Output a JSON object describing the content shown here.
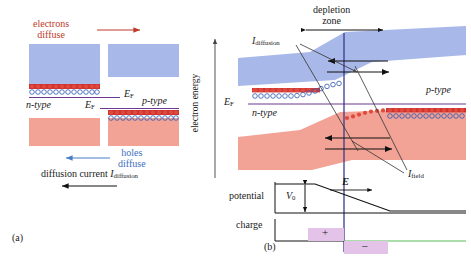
{
  "figure": {
    "panel_a": {
      "caption": "(a)",
      "labels": {
        "electrons_line1": "electrons",
        "electrons_line2": "diffuse",
        "holes_line1": "holes",
        "holes_line2": "diffuse",
        "n_type": "n-type",
        "p_type": "p-type",
        "fermi_left": "E",
        "fermi_left_sub": "F",
        "fermi_right": "E",
        "fermi_right_sub": "F",
        "diffusion_current": "diffusion current",
        "diffusion_current_sym": "I",
        "diffusion_current_sub": "diffusion"
      },
      "colors": {
        "conduction_band": "#a8b8e8",
        "valence_band": "#f2a396",
        "electron_dot": "#cc2222",
        "hole_circle": "#2a56b0",
        "fermi_line": "#6b3a8f",
        "electron_arrow": "#c0392b",
        "hole_arrow": "#4a7fc8",
        "current_arrow": "#111111"
      }
    },
    "axis": {
      "electron_energy": "electron energy"
    },
    "panel_b": {
      "caption": "(b)",
      "labels": {
        "depletion_line1": "depletion",
        "depletion_line2": "zone",
        "n_type": "n-type",
        "p_type": "p-type",
        "fermi": "E",
        "fermi_sub": "F",
        "i_diffusion": "I",
        "i_diffusion_sub": "diffusion",
        "i_field": "I",
        "i_field_sub": "field",
        "potential": "potential",
        "v0": "V",
        "v0_sub": "0",
        "e_field": "E",
        "charge": "charge",
        "charge_positive": "+",
        "charge_negative": "–"
      },
      "colors": {
        "conduction_band": "#a8b8e8",
        "valence_band": "#f2a396",
        "electron_dot": "#cc2222",
        "hole_circle": "#2a56b0",
        "fermi_line": "#6b3a8f",
        "junction_line": "#3a3a8c",
        "charge_positive_fill": "#e8c8e8",
        "charge_negative_fill": "#e8c8e8",
        "charge_baseline": "#55bb55",
        "leader_line": "#777777",
        "arrow": "#111111"
      }
    }
  }
}
